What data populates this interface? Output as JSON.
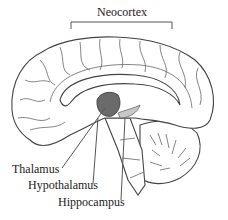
{
  "labels": {
    "neocortex": "Neocortex",
    "thalamus": "Thalamus",
    "hypothalamus": "Hypothalamus",
    "hippocampus": "Hippocampus"
  },
  "colors": {
    "outline": "#444444",
    "thalamus_fill": "#6b6b6b",
    "hippocampus_fill": "#c8c8c8",
    "background": "#ffffff"
  }
}
